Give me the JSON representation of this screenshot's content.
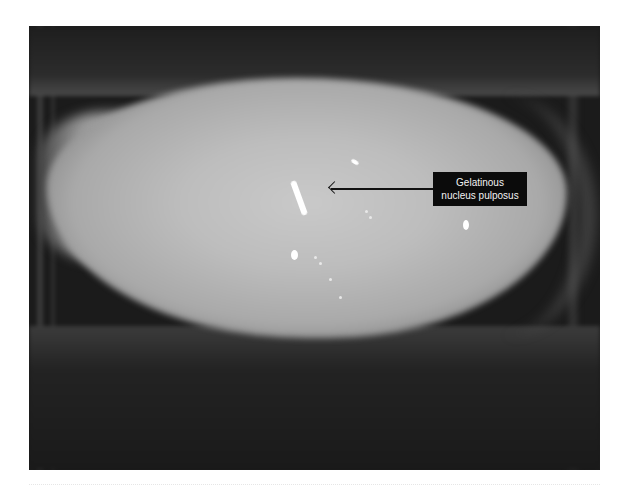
{
  "figure": {
    "annotation": {
      "line1": "Gelatinous",
      "line2": "nucleus pulposus"
    },
    "colors": {
      "label_background": "#0b0b0b",
      "label_text": "#f2f2f2",
      "arrow": "#111111",
      "disc": "#bdbdbd",
      "bone": "#1b1b1b"
    }
  }
}
